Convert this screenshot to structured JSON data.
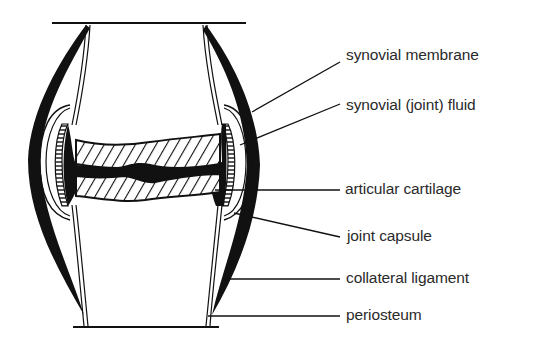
{
  "diagram": {
    "colors": {
      "ink": "#111111",
      "text": "#2a2a2a",
      "background": "#ffffff"
    },
    "labels": [
      {
        "id": "synovial-membrane",
        "text": "synovial membrane",
        "x": 346,
        "y": 32
      },
      {
        "id": "synovial-fluid",
        "text": "synovial (joint) fluid",
        "x": 346,
        "y": 82
      },
      {
        "id": "articular-cartilage",
        "text": "articular cartilage",
        "x": 345,
        "y": 180
      },
      {
        "id": "joint-capsule",
        "text": "joint capsule",
        "x": 347,
        "y": 227
      },
      {
        "id": "collateral-ligament",
        "text": "collateral ligament",
        "x": 346,
        "y": 270
      },
      {
        "id": "periosteum",
        "text": "periosteum",
        "x": 346,
        "y": 307
      }
    ]
  }
}
